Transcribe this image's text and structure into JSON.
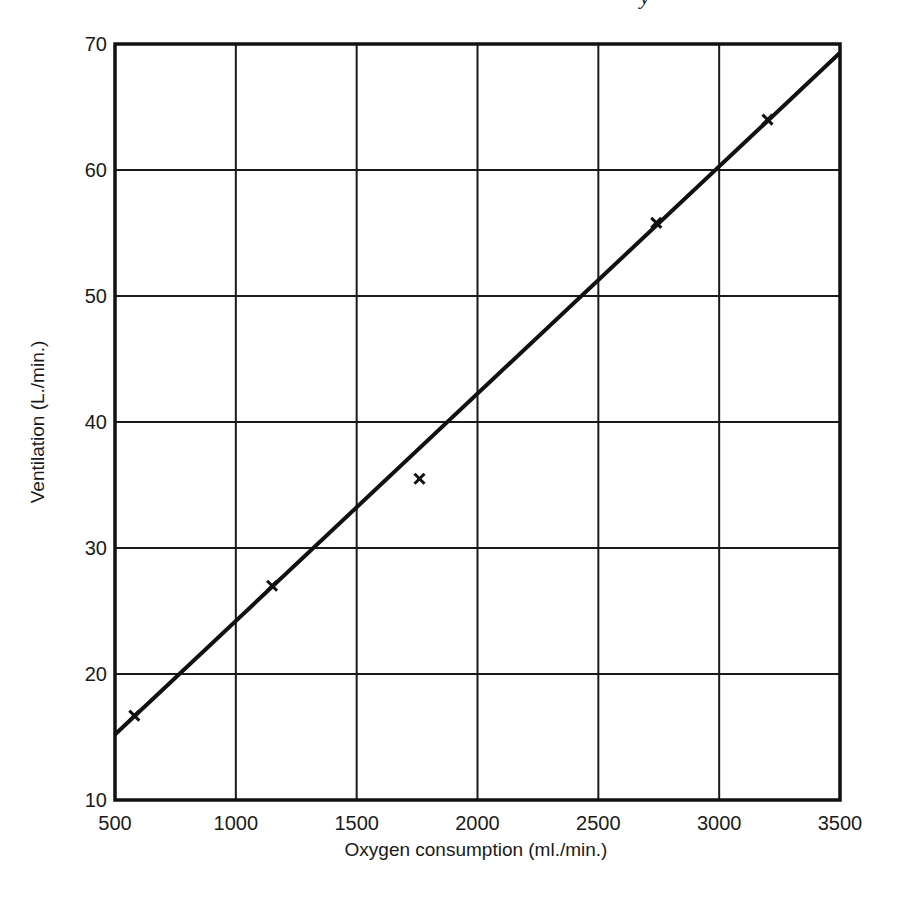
{
  "page_fragment": "y",
  "chart_data": {
    "type": "scatter",
    "title": "",
    "xlabel": "Oxygen consumption (ml./min.)",
    "ylabel": "Ventilation (L./min.)",
    "xlim": [
      500,
      3500
    ],
    "ylim": [
      10,
      70
    ],
    "grid": true,
    "x_ticks": [
      "500",
      "1000",
      "1500",
      "2000",
      "2500",
      "3000",
      "3500"
    ],
    "y_ticks": [
      "10",
      "20",
      "30",
      "40",
      "50",
      "60",
      "70"
    ],
    "series": [
      {
        "name": "Measured points",
        "marker": "x",
        "x": [
          580,
          1150,
          1760,
          2740,
          3200
        ],
        "y": [
          16.7,
          27.0,
          35.5,
          55.8,
          64.0
        ]
      },
      {
        "name": "Fitted line",
        "style": "line",
        "x": [
          500,
          3500
        ],
        "y": [
          15.2,
          69.3
        ]
      }
    ],
    "colors": {
      "line": "#111111",
      "grid": "#1a1a1a",
      "background": "#ffffff"
    }
  }
}
